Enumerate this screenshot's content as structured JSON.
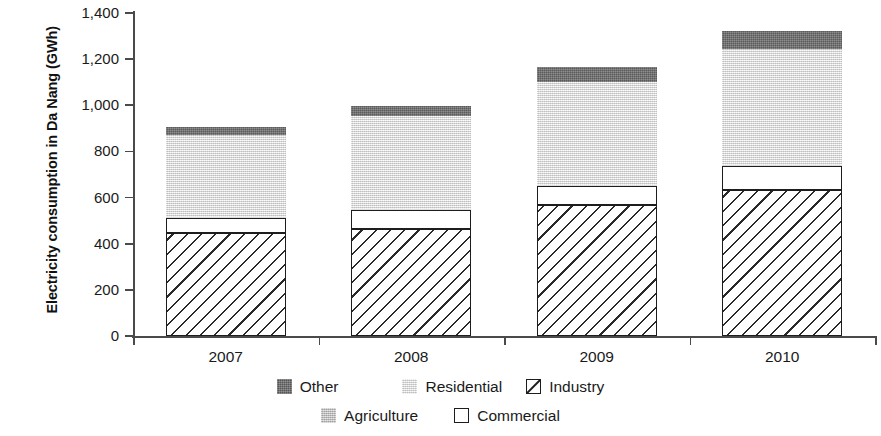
{
  "chart_data": {
    "type": "bar",
    "subtype": "stacked-vertical",
    "title": "",
    "xlabel": "",
    "ylabel": "Electricity consumption in Da Nang (GWh)",
    "categories": [
      "2007",
      "2008",
      "2009",
      "2010"
    ],
    "ylim": [
      0,
      1400
    ],
    "ytick_values": [
      1400,
      1200,
      1000,
      800,
      600,
      400,
      200,
      0
    ],
    "ytick_labels": [
      "1,400",
      "1,200",
      "1,000",
      "800",
      "600",
      "400",
      "200",
      "0"
    ],
    "grid": false,
    "legend_position": "bottom",
    "stack_order_bottom_to_top": [
      "Industry",
      "Commercial",
      "Agriculture",
      "Residential",
      "Other"
    ],
    "series": [
      {
        "name": "Industry",
        "color": "#ffffff",
        "pattern": "diagonal-hatch",
        "values": [
          445,
          465,
          570,
          635
        ]
      },
      {
        "name": "Commercial",
        "color": "#ffffff",
        "pattern": "outline",
        "values": [
          65,
          80,
          80,
          100
        ]
      },
      {
        "name": "Agriculture",
        "color": "#c9c9c9",
        "pattern": "solid-gray",
        "values": [
          5,
          5,
          5,
          5
        ]
      },
      {
        "name": "Residential",
        "color": "#e9e9e9",
        "pattern": "light-speckle",
        "values": [
          355,
          405,
          445,
          505
        ]
      },
      {
        "name": "Other",
        "color": "#6e6e6e",
        "pattern": "dark-speckle",
        "values": [
          35,
          40,
          65,
          75
        ]
      }
    ],
    "totals": [
      905,
      995,
      1165,
      1320
    ]
  },
  "axis": {
    "y_title": "Electricity consumption in Da Nang (GWh)",
    "ticks": [
      {
        "label": "1,400",
        "value": 1400
      },
      {
        "label": "1,200",
        "value": 1200
      },
      {
        "label": "1,000",
        "value": 1000
      },
      {
        "label": "800",
        "value": 800
      },
      {
        "label": "600",
        "value": 600
      },
      {
        "label": "400",
        "value": 400
      },
      {
        "label": "200",
        "value": 200
      },
      {
        "label": "0",
        "value": 0
      }
    ],
    "x_labels": [
      "2007",
      "2008",
      "2009",
      "2010"
    ]
  },
  "legend": {
    "row1": [
      {
        "label": "Other",
        "swatch": "dark-gray-swatch-icon"
      },
      {
        "label": "Residential",
        "swatch": "light-gray-swatch-icon"
      },
      {
        "label": "Industry",
        "swatch": "hatched-swatch-icon"
      }
    ],
    "row2": [
      {
        "label": "Agriculture",
        "swatch": "medium-gray-swatch-icon"
      },
      {
        "label": "Commercial",
        "swatch": "white-outline-swatch-icon"
      }
    ]
  },
  "colors": {
    "other": "#6e6e6e",
    "residential": "#e9e9e9",
    "agriculture": "#c9c9c9",
    "commercial": "#ffffff",
    "industry": "#ffffff",
    "axis": "#4a4a4a",
    "text": "#1a1a1a"
  }
}
